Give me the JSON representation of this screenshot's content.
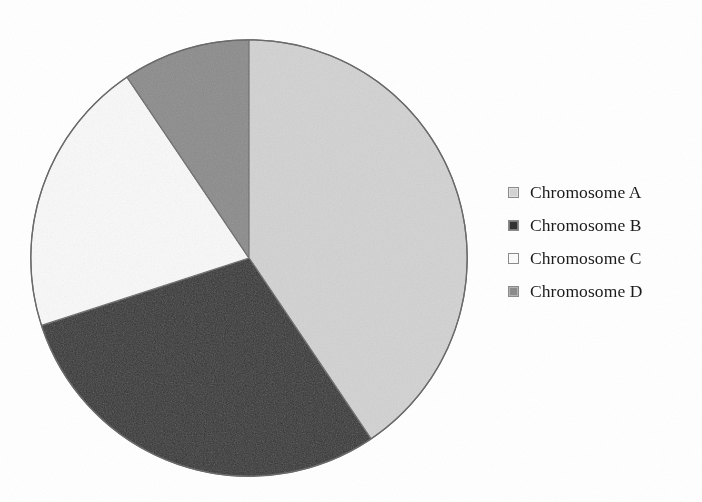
{
  "chart_data": {
    "type": "pie",
    "title": "",
    "subtitle": "",
    "xlabel": "",
    "ylabel": "",
    "grid": false,
    "legend_position": "right",
    "start_angle_deg": 0,
    "direction": "clockwise",
    "categories": [
      "Chromosome A",
      "Chromosome B",
      "Chromosome C",
      "Chromosome D"
    ],
    "values": [
      40.6,
      29.4,
      20.6,
      9.4
    ],
    "value_unit": "%",
    "slices": [
      {
        "label": "Chromosome A",
        "value": 40.6,
        "start_angle_deg": 0,
        "end_angle_deg": 146,
        "color": "#d4d4d4",
        "edge_color": "#6b6b6b"
      },
      {
        "label": "Chromosome B",
        "value": 29.4,
        "start_angle_deg": 146,
        "end_angle_deg": 252,
        "color": "#333333",
        "edge_color": "#6b6b6b"
      },
      {
        "label": "Chromosome C",
        "value": 20.6,
        "start_angle_deg": 252,
        "end_angle_deg": 326,
        "color": "#fbfbfb",
        "edge_color": "#6b6b6b"
      },
      {
        "label": "Chromosome D",
        "value": 9.4,
        "start_angle_deg": 326,
        "end_angle_deg": 360,
        "color": "#8c8c8c",
        "edge_color": "#6b6b6b"
      }
    ]
  },
  "legend": {
    "items": [
      {
        "label": "Chromosome A",
        "color": "#d4d4d4"
      },
      {
        "label": "Chromosome B",
        "color": "#333333"
      },
      {
        "label": "Chromosome C",
        "color": "#fbfbfb"
      },
      {
        "label": "Chromosome D",
        "color": "#8c8c8c"
      }
    ]
  },
  "colors": {
    "background": "#ffffff",
    "outline": "#6b6b6b",
    "text": "#1b1b1b",
    "swatch_border": "#8c8c8c"
  }
}
